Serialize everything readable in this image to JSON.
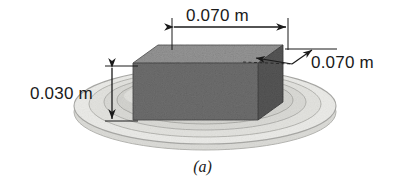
{
  "figure": {
    "caption": "(a)",
    "colors": {
      "line": "#1a1a1a",
      "block_top": "#8e8e8e",
      "block_front": "#6d6d6d",
      "block_right": "#575757",
      "dish_fill": "#e8e8e6",
      "dish_rim": "#d2d2cf",
      "dish_inner": "#dcdcd9",
      "dish_outline": "#a9a9a6",
      "background": "#ffffff"
    },
    "dimensions": [
      {
        "name": "width",
        "label": "0.070 m",
        "value": 0.07,
        "unit": "m",
        "orientation": "horizontal",
        "position": "top"
      },
      {
        "name": "depth",
        "label": "0.070 m",
        "value": 0.07,
        "unit": "m",
        "orientation": "diagonal-leader",
        "position": "right"
      },
      {
        "name": "height",
        "label": "0.030 m",
        "value": 0.03,
        "unit": "m",
        "orientation": "vertical",
        "position": "left"
      }
    ],
    "objects": [
      {
        "name": "rectangular-block",
        "description": "shaded rectangular slab in perspective"
      },
      {
        "name": "circular-dish",
        "description": "shallow elliptical dish with concentric rings"
      }
    ]
  }
}
